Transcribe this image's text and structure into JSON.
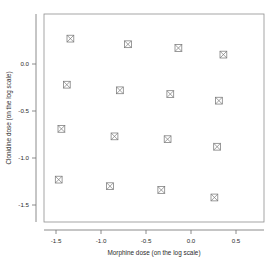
{
  "chart_data": {
    "type": "scatter",
    "title": "",
    "xlabel": "Morphine dose (on the log scale)",
    "ylabel": "Clonidine dose (on the log scale)",
    "xlim": [
      -1.62,
      0.56
    ],
    "ylim": [
      -1.58,
      0.4
    ],
    "xticks": [
      -1.5,
      -1.0,
      -0.5,
      0.0,
      0.5
    ],
    "xticklabels": [
      "-1.5",
      "-1.0",
      "-0.5",
      "0.0",
      "0.5"
    ],
    "yticks": [
      0.0,
      -0.5,
      -1.0,
      -1.5
    ],
    "yticklabels": [
      "0.0",
      "-0.5",
      "-1.0",
      "-1.5"
    ],
    "grid": false,
    "legend": null,
    "marker": "boxed-cross",
    "marker_color": "#7a7a7a",
    "points": [
      {
        "x": -1.34,
        "y": 0.27
      },
      {
        "x": -0.7,
        "y": 0.21
      },
      {
        "x": -0.14,
        "y": 0.17
      },
      {
        "x": 0.36,
        "y": 0.1
      },
      {
        "x": -1.38,
        "y": -0.22
      },
      {
        "x": -0.79,
        "y": -0.28
      },
      {
        "x": -0.23,
        "y": -0.32
      },
      {
        "x": 0.31,
        "y": -0.39
      },
      {
        "x": -1.44,
        "y": -0.69
      },
      {
        "x": -0.85,
        "y": -0.77
      },
      {
        "x": -0.26,
        "y": -0.8
      },
      {
        "x": 0.29,
        "y": -0.88
      },
      {
        "x": -1.47,
        "y": -1.23
      },
      {
        "x": -0.9,
        "y": -1.3
      },
      {
        "x": -0.33,
        "y": -1.34
      },
      {
        "x": 0.26,
        "y": -1.42
      }
    ]
  },
  "axes": {
    "x_title": "Morphine dose (on the log scale)",
    "y_title": "Clonidine dose (on the log scale)"
  }
}
